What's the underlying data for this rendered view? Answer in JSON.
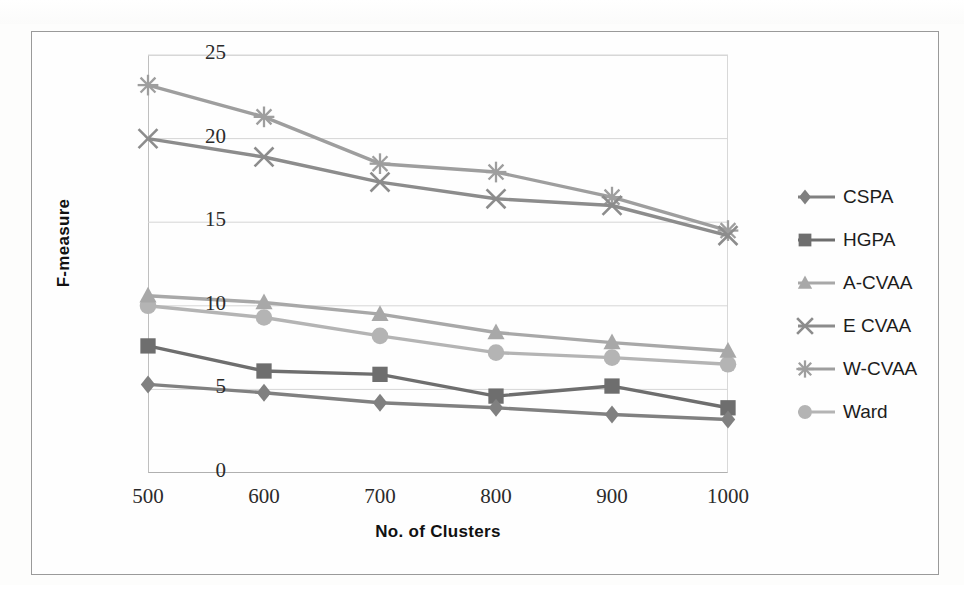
{
  "chart_data": {
    "type": "line",
    "title": "",
    "xlabel": "No. of Clusters",
    "ylabel": "F-measure",
    "categories": [
      500,
      600,
      700,
      800,
      900,
      1000
    ],
    "xtick_labels": [
      "500",
      "600",
      "700",
      "800",
      "900",
      "1000"
    ],
    "ytick_labels": [
      "0",
      "5",
      "10",
      "15",
      "20",
      "25"
    ],
    "ylim": [
      0,
      25
    ],
    "ytick_step": 5,
    "xlim": [
      500,
      1000
    ],
    "grid": "horizontal",
    "legend_position": "right",
    "series": [
      {
        "name": "CSPA",
        "marker": "diamond",
        "color": "#808080",
        "values": [
          5.3,
          4.8,
          4.2,
          3.9,
          3.5,
          3.2
        ]
      },
      {
        "name": "HGPA",
        "marker": "square",
        "color": "#6e6e6e",
        "values": [
          7.6,
          6.1,
          5.9,
          4.6,
          5.2,
          3.9
        ]
      },
      {
        "name": "A-CVAA",
        "marker": "triangle",
        "color": "#a8a8a8",
        "values": [
          10.6,
          10.2,
          9.5,
          8.4,
          7.8,
          7.3
        ]
      },
      {
        "name": "E CVAA",
        "marker": "cross",
        "color": "#8c8c8c",
        "values": [
          20.0,
          18.9,
          17.4,
          16.4,
          16.0,
          14.2
        ]
      },
      {
        "name": "W-CVAA",
        "marker": "star",
        "color": "#9e9e9e",
        "values": [
          23.2,
          21.3,
          18.5,
          18.0,
          16.5,
          14.5
        ]
      },
      {
        "name": "Ward",
        "marker": "circle",
        "color": "#b4b4b4",
        "values": [
          10.0,
          9.3,
          8.2,
          7.2,
          6.9,
          6.5
        ]
      }
    ]
  },
  "legend": {
    "items": [
      {
        "label": "CSPA"
      },
      {
        "label": "HGPA"
      },
      {
        "label": "A-CVAA"
      },
      {
        "label": "E CVAA"
      },
      {
        "label": "W-CVAA"
      },
      {
        "label": "Ward"
      }
    ]
  },
  "axes": {
    "y_label": "F-measure",
    "x_label": "No. of Clusters"
  }
}
